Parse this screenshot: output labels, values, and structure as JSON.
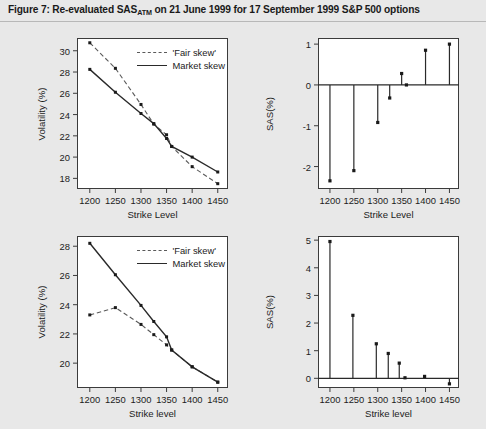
{
  "figure": {
    "title_prefix": "Figure 7: Re-evaluated SAS",
    "title_sub": "ATM",
    "title_suffix": " on 21 June 1999 for 17 September 1999 S&P 500 options",
    "background_color": "#e8e8e8",
    "panel_color": "#ffffff",
    "line_color": "#2a2a2a",
    "dash_color": "#5a5a5a"
  },
  "legend": {
    "fair_skew": "'Fair skew'",
    "market_skew": "Market skew"
  },
  "chart_data": [
    {
      "id": "top-left",
      "type": "line",
      "title": "",
      "xlabel": "Strike Level",
      "ylabel": "Volatility (%)",
      "xlim": [
        1175,
        1470
      ],
      "ylim": [
        17.0,
        31.2
      ],
      "xticks": [
        1200,
        1250,
        1300,
        1350,
        1400,
        1450
      ],
      "yticks": [
        18,
        20,
        22,
        24,
        26,
        28,
        30
      ],
      "grid": false,
      "legend_position": "top-right",
      "series": [
        {
          "name": "'Fair skew'",
          "style": "dashed",
          "x": [
            1200,
            1250,
            1300,
            1325,
            1350,
            1360,
            1400,
            1450
          ],
          "values": [
            30.75,
            28.35,
            24.95,
            23.1,
            22.1,
            21.0,
            19.1,
            17.5
          ]
        },
        {
          "name": "Market skew",
          "style": "solid",
          "x": [
            1200,
            1250,
            1300,
            1325,
            1350,
            1360,
            1400,
            1450
          ],
          "values": [
            28.25,
            26.1,
            24.1,
            23.15,
            21.75,
            21.0,
            20.0,
            18.6
          ]
        }
      ]
    },
    {
      "id": "top-right",
      "type": "stem",
      "title": "",
      "xlabel": "Strike Level",
      "ylabel": "SAS(%)",
      "xlim": [
        1175,
        1470
      ],
      "ylim": [
        -2.55,
        1.15
      ],
      "xticks": [
        1200,
        1250,
        1300,
        1350,
        1400,
        1450
      ],
      "yticks": [
        -2,
        -1,
        0,
        1
      ],
      "grid": false,
      "baseline": 0,
      "x": [
        1200,
        1250,
        1300,
        1325,
        1350,
        1360,
        1400,
        1450
      ],
      "values": [
        -2.35,
        -2.1,
        -0.92,
        -0.32,
        0.28,
        0.0,
        0.85,
        1.0
      ]
    },
    {
      "id": "bottom-left",
      "type": "line",
      "title": "",
      "xlabel": "Strike level",
      "ylabel": "Volatility (%)",
      "xlim": [
        1175,
        1470
      ],
      "ylim": [
        18.3,
        28.7
      ],
      "xticks": [
        1200,
        1250,
        1300,
        1350,
        1400,
        1450
      ],
      "yticks": [
        20,
        22,
        24,
        26,
        28
      ],
      "grid": false,
      "legend_position": "top-right",
      "series": [
        {
          "name": "'Fair skew'",
          "style": "dashed",
          "x": [
            1200,
            1250,
            1300,
            1325,
            1350,
            1360,
            1400,
            1450
          ],
          "values": [
            23.3,
            23.8,
            22.65,
            21.95,
            21.25,
            20.9,
            19.75,
            18.7
          ]
        },
        {
          "name": "Market skew",
          "style": "solid",
          "x": [
            1200,
            1250,
            1300,
            1325,
            1350,
            1360,
            1400,
            1450
          ],
          "values": [
            28.2,
            26.05,
            23.95,
            22.85,
            21.8,
            20.9,
            19.75,
            18.7
          ]
        }
      ]
    },
    {
      "id": "bottom-right",
      "type": "stem",
      "title": "",
      "xlabel": "Strike level",
      "ylabel": "SAS(%)",
      "xlim": [
        1175,
        1470
      ],
      "ylim": [
        -0.35,
        5.15
      ],
      "xticks": [
        1200,
        1250,
        1300,
        1350,
        1400,
        1450
      ],
      "yticks": [
        0,
        1,
        2,
        3,
        4,
        5
      ],
      "grid": false,
      "baseline": 0,
      "x": [
        1200,
        1248,
        1297,
        1322,
        1345,
        1357,
        1398,
        1450
      ],
      "values": [
        4.95,
        2.28,
        1.25,
        0.9,
        0.55,
        0.02,
        0.07,
        -0.2
      ]
    }
  ]
}
